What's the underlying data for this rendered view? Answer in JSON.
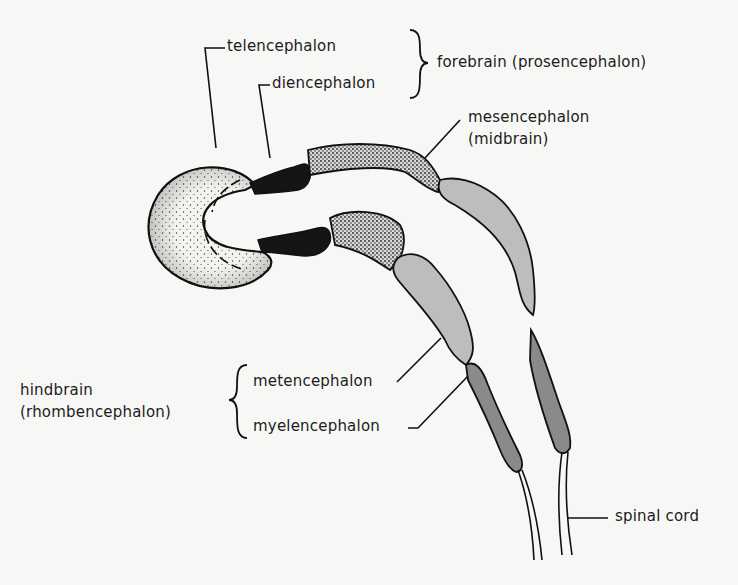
{
  "diagram": {
    "labels": {
      "telencephalon": "telencephalon",
      "diencephalon": "diencephalon",
      "forebrain": "forebrain (prosencephalon)",
      "mesencephalon": "mesencephalon",
      "midbrain": "(midbrain)",
      "hindbrain": "hindbrain",
      "rhombencephalon": "(rhombencephalon)",
      "metencephalon": "metencephalon",
      "myelencephalon": "myelencephalon",
      "spinal_cord": "spinal cord"
    },
    "groups": [
      {
        "name": "forebrain (prosencephalon)",
        "members": [
          "telencephalon",
          "diencephalon"
        ]
      },
      {
        "name": "midbrain",
        "members": [
          "mesencephalon"
        ]
      },
      {
        "name": "hindbrain (rhombencephalon)",
        "members": [
          "metencephalon",
          "myelencephalon"
        ]
      }
    ],
    "colors": {
      "background": "#f7f7f5",
      "outline": "#111111",
      "diencephalon_fill": "#151515",
      "metencephalon_fill": "#bdbdbd",
      "myelencephalon_fill": "#8a8a8a",
      "stipple_light": "#f3f3f0"
    }
  }
}
